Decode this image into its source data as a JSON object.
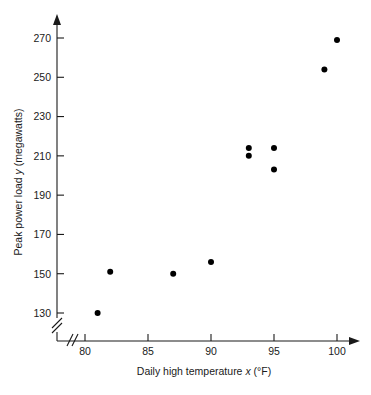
{
  "chart_data": {
    "type": "scatter",
    "title": "",
    "xlabel": "Daily high temperature x (°F)",
    "ylabel": "Peak power load y (megawatts)",
    "xlabel_parts": {
      "pre": "Daily high temperature ",
      "italic": "x",
      "post": " (°F)"
    },
    "ylabel_parts": {
      "pre": "Peak power load ",
      "italic": "y",
      "post": " (megawatts)"
    },
    "xlim": [
      78.8,
      101.8
    ],
    "ylim": [
      122,
      277
    ],
    "xticks": [
      80,
      85,
      90,
      95,
      100
    ],
    "xtick_labels": [
      "80",
      "85",
      "90",
      "95",
      "100"
    ],
    "yticks": [
      130,
      150,
      170,
      190,
      210,
      230,
      250,
      270
    ],
    "ytick_labels": [
      "130",
      "150",
      "170",
      "190",
      "210",
      "230",
      "250",
      "270"
    ],
    "grid": false,
    "legend": null,
    "axis_break_x": true,
    "axis_break_y": true,
    "marker": "filled-circle",
    "marker_color": "#000000",
    "marker_size_px": 3.0,
    "x": [
      81,
      82,
      87,
      90,
      93,
      93,
      95,
      95,
      99,
      100
    ],
    "y": [
      130,
      151,
      150,
      156,
      214,
      210,
      214,
      203,
      254,
      269
    ],
    "points": [
      {
        "x": 81,
        "y": 130
      },
      {
        "x": 82,
        "y": 151
      },
      {
        "x": 87,
        "y": 150
      },
      {
        "x": 90,
        "y": 156
      },
      {
        "x": 93,
        "y": 214
      },
      {
        "x": 93,
        "y": 210
      },
      {
        "x": 95,
        "y": 214
      },
      {
        "x": 95,
        "y": 203
      },
      {
        "x": 99,
        "y": 254
      },
      {
        "x": 100,
        "y": 269
      }
    ]
  },
  "colors": {
    "axis": "#1a1a1a",
    "marker": "#000000",
    "background": "#ffffff"
  }
}
